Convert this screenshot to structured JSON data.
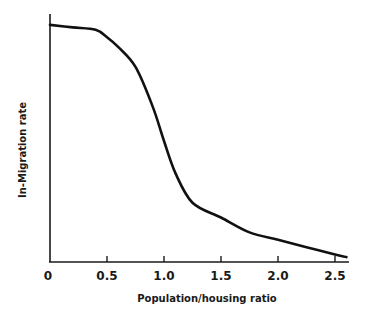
{
  "chart_data": {
    "type": "line",
    "title": "",
    "xlabel": "Population/housing ratio",
    "ylabel": "In-Migration rate",
    "xlim": [
      0,
      2.6
    ],
    "ylim": [
      0,
      1.0
    ],
    "grid": false,
    "legend": null,
    "x_ticks": [
      {
        "value": 0,
        "label": "0"
      },
      {
        "value": 0.5,
        "label": "0.5"
      },
      {
        "value": 1.0,
        "label": "1.0"
      },
      {
        "value": 1.5,
        "label": "1.5"
      },
      {
        "value": 2.0,
        "label": "2.0"
      },
      {
        "value": 2.5,
        "label": "2.5"
      }
    ],
    "y_ticks": [],
    "series": [
      {
        "name": "In-Migration rate",
        "color": "#111111",
        "x": [
          0,
          0.2,
          0.4,
          0.5,
          0.6,
          0.75,
          0.9,
          1.0,
          1.1,
          1.25,
          1.5,
          1.75,
          2.0,
          2.25,
          2.5,
          2.6
        ],
        "values": [
          0.96,
          0.95,
          0.94,
          0.91,
          0.87,
          0.79,
          0.63,
          0.49,
          0.36,
          0.24,
          0.18,
          0.12,
          0.09,
          0.06,
          0.03,
          0.02
        ]
      }
    ]
  }
}
